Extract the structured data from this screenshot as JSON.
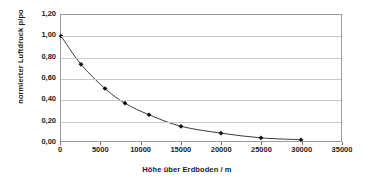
{
  "chart_data": {
    "type": "line",
    "title": "",
    "xlabel": "Höhe über Erdboden / m",
    "ylabel": "normierter Luftdruck p/po",
    "xlim": [
      0,
      35000
    ],
    "ylim": [
      0,
      1.2
    ],
    "grid": true,
    "legend": "none",
    "marker": "filled-diamond",
    "x_tick_labels": [
      "0",
      "5000",
      "10000",
      "15000",
      "20000",
      "25000",
      "30000",
      "35000"
    ],
    "x_ticks": [
      0,
      5000,
      10000,
      15000,
      20000,
      25000,
      30000,
      35000
    ],
    "y_tick_labels": [
      "0,00",
      "0,20",
      "0,40",
      "0,60",
      "0,80",
      "1,00",
      "1,20"
    ],
    "y_ticks": [
      0,
      0.2,
      0.4,
      0.6,
      0.8,
      1.0,
      1.2
    ],
    "series": [
      {
        "name": "normierter Luftdruck",
        "x": [
          0,
          2500,
          5500,
          8000,
          11000,
          15000,
          20000,
          25000,
          30000
        ],
        "values": [
          1.0,
          0.73,
          0.5,
          0.36,
          0.25,
          0.14,
          0.075,
          0.03,
          0.012
        ]
      }
    ],
    "colors": {
      "line": "#3a3a3a",
      "marker": "#111111",
      "grid": "#c9c9c9",
      "axis": "#9a9a9a",
      "plot_background": "#ffffff"
    }
  }
}
